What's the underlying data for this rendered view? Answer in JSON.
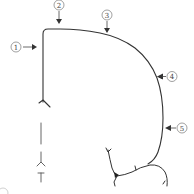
{
  "diagram": {
    "stroke_color": "#333333",
    "callout_color": "#555555",
    "callouts": [
      {
        "label": "①",
        "number": "1"
      },
      {
        "label": "②",
        "number": "2"
      },
      {
        "label": "③",
        "number": "3"
      },
      {
        "label": "④",
        "number": "4"
      },
      {
        "label": "⑤",
        "number": "5"
      }
    ]
  }
}
